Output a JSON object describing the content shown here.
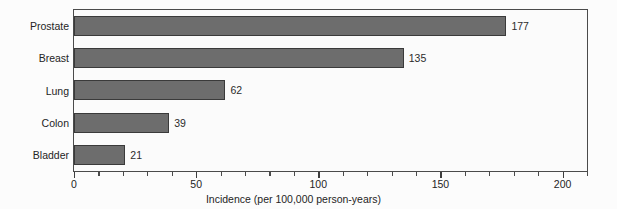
{
  "chart_data": {
    "type": "bar",
    "orientation": "horizontal",
    "title": "",
    "subtitle": "",
    "categories": [
      "Prostate",
      "Breast",
      "Lung",
      "Colon",
      "Bladder"
    ],
    "values": [
      177,
      135,
      62,
      39,
      21
    ],
    "value_labels": [
      "177",
      "135",
      "62",
      "39",
      "21"
    ],
    "series": [
      {
        "name": "Incidence",
        "values": [
          177,
          135,
          62,
          39,
          21
        ]
      }
    ],
    "xlabel": "Incidence (per 100,000 person-years)",
    "ylabel": "",
    "xlim": [
      0,
      210
    ],
    "xticks": [
      0,
      50,
      100,
      150,
      200
    ],
    "xticklabels": [
      "0",
      "50",
      "100",
      "150",
      "200"
    ],
    "xminor_tick_interval": 10,
    "grid": false,
    "legend": null,
    "legend_position": "none",
    "bar_color": "#6d6d6d",
    "bar_edge_color": "#3a3a3a",
    "frame_color": "#4b4b4b",
    "plot_background": "#fbfbfb",
    "text_color": "#242424"
  }
}
